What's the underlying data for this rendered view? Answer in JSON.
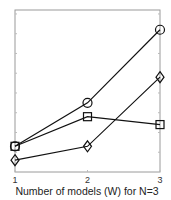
{
  "chart_data": {
    "type": "line",
    "title": "",
    "xlabel": "Number of models (W) for N=3",
    "ylabel": "",
    "x": [
      1,
      2,
      3
    ],
    "xticks": [
      "1",
      "2",
      "3"
    ],
    "yticks_labeled": false,
    "ylim": [
      0,
      8.2
    ],
    "grid": false,
    "legend": null,
    "series": [
      {
        "name": "circle",
        "marker": "circle",
        "values": [
          1.3,
          3.5,
          7.2
        ]
      },
      {
        "name": "square",
        "marker": "square",
        "values": [
          1.3,
          2.8,
          2.4
        ]
      },
      {
        "name": "diamond",
        "marker": "diamond",
        "values": [
          0.6,
          1.3,
          4.8
        ]
      }
    ]
  },
  "colors": {
    "line": "#111111",
    "axis": "#888888",
    "background": "#ffffff"
  },
  "labels": {
    "xlabel": "Number of models (W) for N=3",
    "xtick_1": "1",
    "xtick_2": "2",
    "xtick_3": "3"
  }
}
